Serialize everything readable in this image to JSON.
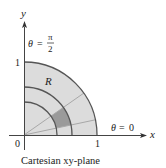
{
  "diagram": {
    "caption": "Cartesian xy-plane",
    "axes": {
      "x_label": "x",
      "y_label": "y",
      "origin_label": "0",
      "x_tick_label": "1",
      "y_tick_label": "1"
    },
    "region_label": "R",
    "angle_labels": {
      "top": {
        "theta": "θ",
        "eq": "=",
        "num": "π",
        "den": "2"
      },
      "right": {
        "theta": "θ",
        "eq": "=",
        "val": "0"
      }
    },
    "colors": {
      "region_fill": "#dcdcdc",
      "highlight_cell": "#9a9a9a",
      "outline": "#555555",
      "rays": "#9e9e9e"
    },
    "geometry": {
      "radii": [
        0.45,
        0.66,
        1.0
      ],
      "ray_angles_deg": [
        12,
        35
      ]
    }
  }
}
